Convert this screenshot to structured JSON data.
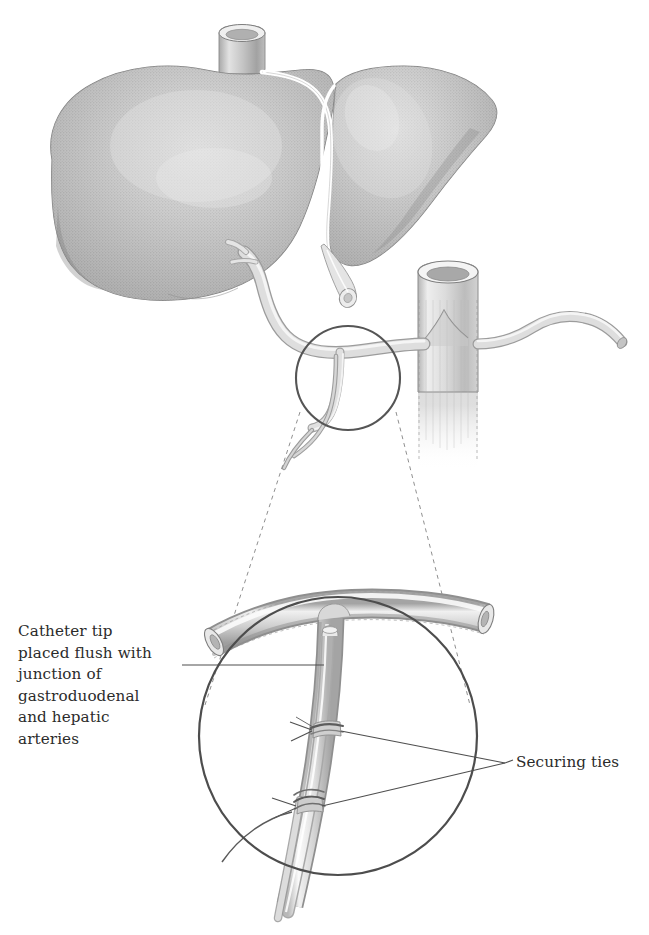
{
  "figure": {
    "background_color": "#ffffff",
    "width": 649,
    "height": 935
  },
  "labels": {
    "catheter_tip": {
      "text": "Catheter tip\nplaced flush with\njunction of\ngastroduodenal\nand hepatic\narteries",
      "lines": [
        "Catheter tip",
        "placed flush with",
        "junction of",
        "gastroduodenal",
        "and hepatic",
        "arteries"
      ],
      "position": "left",
      "color": "#2b2b2b"
    },
    "securing_ties": {
      "text": "Securing ties",
      "lines": [
        "Securing ties"
      ],
      "position": "right",
      "color": "#2b2b2b"
    }
  },
  "anatomy": {
    "organs": [
      {
        "name": "liver-right-lobe",
        "label": "Right lobe of liver"
      },
      {
        "name": "liver-left-lobe",
        "label": "Left lobe of liver"
      },
      {
        "name": "inferior-vena-cava-stump",
        "label": "Inferior vena cava stump"
      },
      {
        "name": "falciform-ligament",
        "label": "Falciform ligament"
      },
      {
        "name": "cystic-duct-stump",
        "label": "Cut duct stump"
      },
      {
        "name": "aorta",
        "label": "Aorta"
      },
      {
        "name": "celiac-trunk",
        "label": "Celiac trunk"
      },
      {
        "name": "common-hepatic-artery",
        "label": "Common hepatic artery"
      },
      {
        "name": "gastroduodenal-artery",
        "label": "Gastroduodenal artery"
      },
      {
        "name": "catheter",
        "label": "Indwelling catheter"
      },
      {
        "name": "securing-tie-upper",
        "label": "Upper securing tie"
      },
      {
        "name": "securing-tie-lower",
        "label": "Lower securing tie"
      }
    ]
  },
  "insets": {
    "marker_circle": {
      "name": "detail-marker-circle",
      "cx": 348,
      "cy": 378,
      "r": 52
    },
    "magnified_circle": {
      "name": "magnified-detail-circle",
      "cx": 338,
      "cy": 736,
      "r": 139
    },
    "projection_style": "dashed"
  },
  "colors": {
    "ink": "#444444",
    "ink_dark": "#333333",
    "text": "#2b2b2b",
    "tissue_mid": "#9a9a9a",
    "tissue_light": "#d3d3d3",
    "tissue_lighter": "#e6e6e6",
    "tissue_dark": "#7c7c7c",
    "vessel_fill": "#d8d8d8",
    "vessel_shade": "#b4b4b4",
    "vessel_high": "#f2f2f2",
    "outline": "#8c8c8c"
  }
}
